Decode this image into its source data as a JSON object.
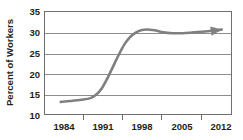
{
  "chart_data": {
    "type": "line",
    "title": "",
    "xlabel": "",
    "ylabel": "Percent of Workers",
    "xlim": [
      1982.5,
      2016.0
    ],
    "ylim": [
      10,
      35
    ],
    "grid": true,
    "legend": null,
    "y_ticks": [
      35,
      30,
      25,
      20,
      15,
      10
    ],
    "y_tick_labels": [
      "35",
      "30",
      "25",
      "20",
      "15",
      "10"
    ],
    "x_ticks": [
      1984,
      1991,
      1998,
      2005,
      2012
    ],
    "x_tick_labels": [
      "1984",
      "1991",
      "1998",
      "2005",
      "2012"
    ],
    "line_color": "#7f8082",
    "axis_color": "#6d6e71",
    "grid_color": "#8c8d8f",
    "text_color": "#231f20",
    "annotations": [
      {
        "name": "trend-arrowhead",
        "x": 2014.0,
        "y": 30.8,
        "note": "arrowhead at right end of curve"
      }
    ],
    "series": [
      {
        "name": "Percent of Workers",
        "x": [
          1985.3,
          1987.0,
          1989.0,
          1990.6,
          1991.6,
          1992.6,
          1993.6,
          1994.6,
          1995.6,
          1996.6,
          1997.6,
          1998.6,
          1999.6,
          2000.6,
          2002.0,
          2003.6,
          2005.2,
          2007.0,
          2009.0,
          2011.0,
          2013.0,
          2014.0
        ],
        "y": [
          13.4,
          13.6,
          13.9,
          14.3,
          15.1,
          16.6,
          19.0,
          21.8,
          24.6,
          27.1,
          28.9,
          30.0,
          30.6,
          30.8,
          30.6,
          30.1,
          29.9,
          29.9,
          30.1,
          30.3,
          30.6,
          30.8
        ]
      }
    ]
  }
}
